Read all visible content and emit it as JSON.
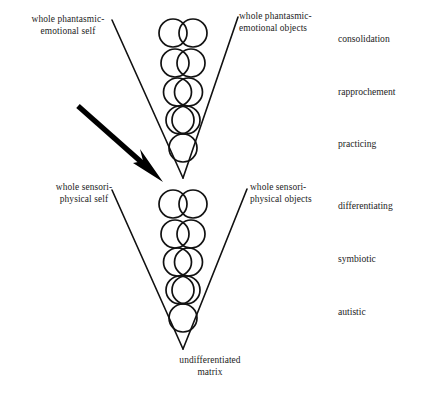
{
  "figure": {
    "background_color": "#ffffff",
    "stroke_color": "#111111",
    "arrow_color": "#000000"
  },
  "labels": {
    "phantasmic_self": "whole phantasmic-\nemotional self",
    "phantasmic_objects": "whole phantasmic-\nemotional objects",
    "sensoriphysical_self": "whole sensori-\nphysical self",
    "sensoriphysical_objects": "whole sensori-\nphysical objects",
    "undifferentiated_matrix": "undifferentiated\nmatrix"
  },
  "stages": [
    {
      "key": "consolidation",
      "label": "consolidation"
    },
    {
      "key": "rapprochement",
      "label": "rapprochement"
    },
    {
      "key": "practicing",
      "label": "practicing"
    },
    {
      "key": "differentiating",
      "label": "differentiating"
    },
    {
      "key": "symbiotic",
      "label": "symbiotic"
    },
    {
      "key": "autistic",
      "label": "autistic"
    }
  ],
  "diagram_data": {
    "type": "diagram",
    "upper_cone": {
      "name": "phantasmic-emotional cone",
      "apex": {
        "x": 183,
        "y": 178
      },
      "left_top": {
        "x": 112,
        "y": 20
      },
      "right_top": {
        "x": 238,
        "y": 17
      },
      "rows": [
        {
          "index": 1,
          "cy": 33,
          "separation": 20,
          "r": 14,
          "state": "two distinct circles touching"
        },
        {
          "index": 2,
          "cy": 63,
          "separation": 16,
          "r": 14,
          "state": "slight overlap"
        },
        {
          "index": 3,
          "cy": 92,
          "separation": 11,
          "r": 14,
          "state": "moderate overlap"
        },
        {
          "index": 4,
          "cy": 120,
          "separation": 6,
          "r": 14,
          "state": "heavy overlap"
        },
        {
          "index": 5,
          "cy": 148,
          "separation": 0,
          "r": 14,
          "state": "fused single circle"
        }
      ]
    },
    "lower_cone": {
      "name": "sensori-physical cone",
      "apex": {
        "x": 183,
        "y": 349
      },
      "left_top": {
        "x": 112,
        "y": 190
      },
      "right_top": {
        "x": 247,
        "y": 189
      },
      "rows": [
        {
          "index": 1,
          "cy": 204,
          "separation": 20,
          "r": 14,
          "state": "two distinct circles touching"
        },
        {
          "index": 2,
          "cy": 234,
          "separation": 16,
          "r": 14,
          "state": "slight overlap"
        },
        {
          "index": 3,
          "cy": 262,
          "separation": 11,
          "r": 14,
          "state": "moderate overlap"
        },
        {
          "index": 4,
          "cy": 290,
          "separation": 6,
          "r": 14,
          "state": "heavy overlap"
        },
        {
          "index": 5,
          "cy": 318,
          "separation": 0,
          "r": 14,
          "state": "fused single circle"
        }
      ]
    },
    "arrow": {
      "name": "pointer-arrow",
      "from": {
        "x": 78,
        "y": 106
      },
      "to": {
        "x": 163,
        "y": 182
      },
      "points_at": "junction between sensori-physical and phantasmic-emotional cones"
    }
  }
}
